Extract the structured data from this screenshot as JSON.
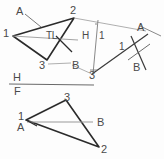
{
  "sheet": {
    "title": "Descriptive geometry: true length and point view of line",
    "background": "#fdfdfd",
    "ink": "#2b2b2b",
    "thin_ink": "#8a8a8a",
    "label_color": "#4a4a4a"
  },
  "fold_line": {
    "upper_label": "H",
    "lower_label": "F"
  },
  "auxiliary_fold": {
    "left_label": "H",
    "right_label": "1"
  },
  "views": {
    "horizontal_view": {
      "name": "Top (H) view of triangle 1-2-3",
      "vertices": [
        {
          "label": "1",
          "x": 10,
          "y": 33
        },
        {
          "label": "2",
          "x": 72,
          "y": 13
        },
        {
          "label": "3",
          "x": 43,
          "y": 62
        }
      ],
      "annotations": [
        {
          "label": "A",
          "x": 17,
          "y": 11
        },
        {
          "label": "B",
          "x": 74,
          "y": 63
        },
        {
          "label": "TL",
          "x": 48,
          "y": 35
        }
      ]
    },
    "auxiliary_view": {
      "name": "Auxiliary (1) view, line AB appears as point",
      "annotations": [
        {
          "label": "A",
          "x": 139,
          "y": 28
        },
        {
          "label": "B",
          "x": 134,
          "y": 67
        },
        {
          "label": "1",
          "x": 121,
          "y": 47
        }
      ],
      "projection_points": [
        {
          "label": "2",
          "x": 72,
          "y": 13
        },
        {
          "label": "3",
          "x": 92,
          "y": 72
        }
      ]
    },
    "frontal_view": {
      "name": "Front (F) view of triangle 1-2-3",
      "vertices": [
        {
          "label": "3",
          "x": 68,
          "y": 96
        },
        {
          "label": "1",
          "x": 22,
          "y": 116
        },
        {
          "label": "2",
          "x": 105,
          "y": 148
        }
      ],
      "annotations": [
        {
          "label": "A",
          "x": 22,
          "y": 127
        },
        {
          "label": "B",
          "x": 100,
          "y": 122
        }
      ]
    }
  },
  "labels": {
    "true_length": "TL",
    "point_a": "A",
    "point_b": "B",
    "vertex_1": "1",
    "vertex_2": "2",
    "vertex_3": "3"
  }
}
